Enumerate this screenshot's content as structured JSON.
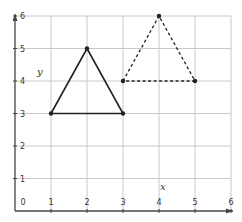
{
  "chart_data": {
    "type": "scatter",
    "title": "",
    "xlabel": "x",
    "ylabel": "y",
    "xlim": [
      0,
      6
    ],
    "ylim": [
      0,
      6
    ],
    "grid": true,
    "x_ticks": [
      "0",
      "1",
      "2",
      "3",
      "4",
      "5",
      "6"
    ],
    "y_ticks": [
      "1",
      "2",
      "3",
      "4",
      "5",
      "6"
    ],
    "series": [
      {
        "name": "original-triangle",
        "style": "solid",
        "closed": true,
        "points": [
          [
            1,
            3
          ],
          [
            2,
            5
          ],
          [
            3,
            3
          ]
        ]
      },
      {
        "name": "translated-triangle",
        "style": "dashed",
        "closed": true,
        "points": [
          [
            3,
            4
          ],
          [
            4,
            6
          ],
          [
            5,
            4
          ]
        ]
      }
    ]
  },
  "colors": {
    "grid": "#c8c8c8",
    "axis": "#444444",
    "shape": "#222222"
  }
}
